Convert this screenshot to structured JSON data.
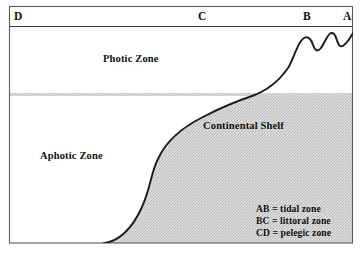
{
  "diagram": {
    "title_absent": true,
    "corner_labels": [
      {
        "name": "D",
        "text": "D"
      },
      {
        "name": "C",
        "text": "C"
      },
      {
        "name": "B",
        "text": "B"
      },
      {
        "name": "A",
        "text": "A"
      }
    ],
    "zone_labels": {
      "photic": "Photic Zone",
      "aphotic": "Aphotic Zone",
      "continental_shelf": "Continental Shelf"
    },
    "legend": {
      "line1": "AB = tidal zone",
      "line2": "BC = littoral zone",
      "line3": "CD = pelegic zone"
    },
    "colors": {
      "frame": "#555555",
      "ink": "#111111",
      "aphotic_fill": "#d2d2d2",
      "aphotic_fill_alt": "#c4c4c4",
      "background": "#ffffff"
    }
  }
}
